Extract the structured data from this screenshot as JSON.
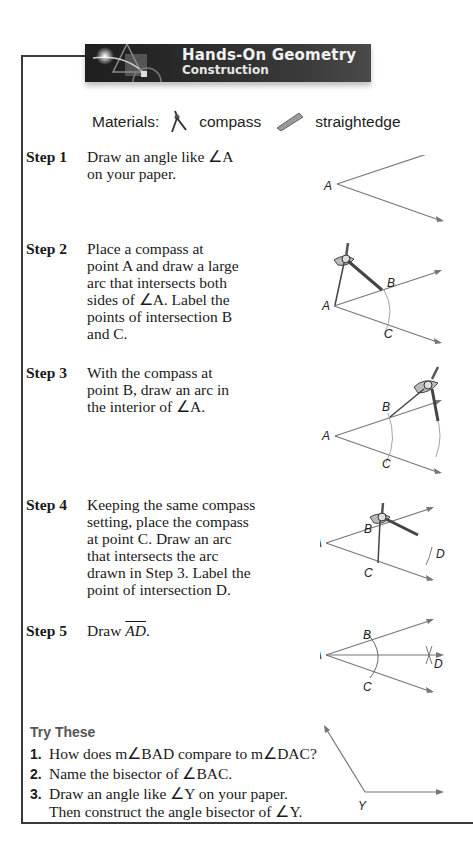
{
  "banner": {
    "title": "Hands-On Geometry",
    "subtitle": "Construction"
  },
  "materials": {
    "label": "Materials:",
    "items": [
      {
        "icon": "compass-icon",
        "label": "compass"
      },
      {
        "icon": "straightedge-icon",
        "label": "straightedge"
      }
    ]
  },
  "steps": [
    {
      "label": "Step 1",
      "lines": [
        "Draw an angle like ∠A",
        "on your paper."
      ]
    },
    {
      "label": "Step 2",
      "lines": [
        "Place a compass at",
        "point A and draw a large",
        "arc that intersects both",
        "sides of ∠A. Label the",
        "points of intersection B",
        "and C."
      ]
    },
    {
      "label": "Step 3",
      "lines": [
        "With the compass at",
        "point B, draw an arc in",
        "the interior of ∠A."
      ]
    },
    {
      "label": "Step 4",
      "lines": [
        "Keeping the same compass",
        "setting, place the compass",
        "at point C. Draw an arc",
        "that intersects the arc",
        "drawn in Step 3. Label the",
        "point of intersection D."
      ]
    },
    {
      "label": "Step 5",
      "prefix": "Draw ",
      "ray": "AD",
      "suffix": "."
    }
  ],
  "figure_labels": {
    "A": "A",
    "B": "B",
    "C": "C",
    "D": "D",
    "Y": "Y"
  },
  "try_these": {
    "title": "Try These",
    "items": [
      {
        "num": "1.",
        "lines": [
          "How does m∠BAD compare to m∠DAC?"
        ]
      },
      {
        "num": "2.",
        "lines": [
          "Name the bisector of ∠BAC."
        ]
      },
      {
        "num": "3.",
        "lines": [
          "Draw an angle like ∠Y on your paper.",
          "Then construct the angle bisector of ∠Y."
        ]
      }
    ]
  }
}
